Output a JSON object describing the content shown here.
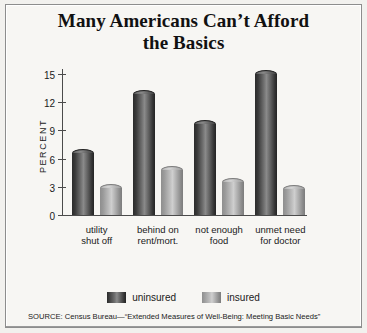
{
  "chart_data": {
    "type": "bar",
    "title_line1": "Many Americans Can’t Afford",
    "title_line2": "the Basics",
    "xlabel": "",
    "ylabel": "PERCENT",
    "ylim": [
      0,
      15
    ],
    "yticks": [
      0,
      3,
      6,
      9,
      12,
      15
    ],
    "ytick_labels": [
      "0",
      "3",
      "6",
      "9",
      "12",
      "15"
    ],
    "grid": false,
    "legend_position": "bottom",
    "categories": [
      "utility shut off",
      "behind on rent/mort.",
      "not enough food",
      "unmet need for doctor"
    ],
    "category_lines": [
      [
        "utility",
        "shut off"
      ],
      [
        "behind on",
        "rent/mort."
      ],
      [
        "not enough",
        "food"
      ],
      [
        "unmet need",
        "for doctor"
      ]
    ],
    "series": [
      {
        "name": "uninsured",
        "color": "#3a3a3a",
        "values": [
          6.6,
          12.9,
          9.7,
          15.0
        ]
      },
      {
        "name": "insured",
        "color": "#a8a8a8",
        "values": [
          2.9,
          4.8,
          3.5,
          2.8
        ]
      }
    ],
    "source": "SOURCE: Census Bureau—“Extended Measures of Well-Being: Meeting Basic Needs”"
  },
  "legend": {
    "items": [
      {
        "label": "uninsured"
      },
      {
        "label": "insured"
      }
    ]
  }
}
